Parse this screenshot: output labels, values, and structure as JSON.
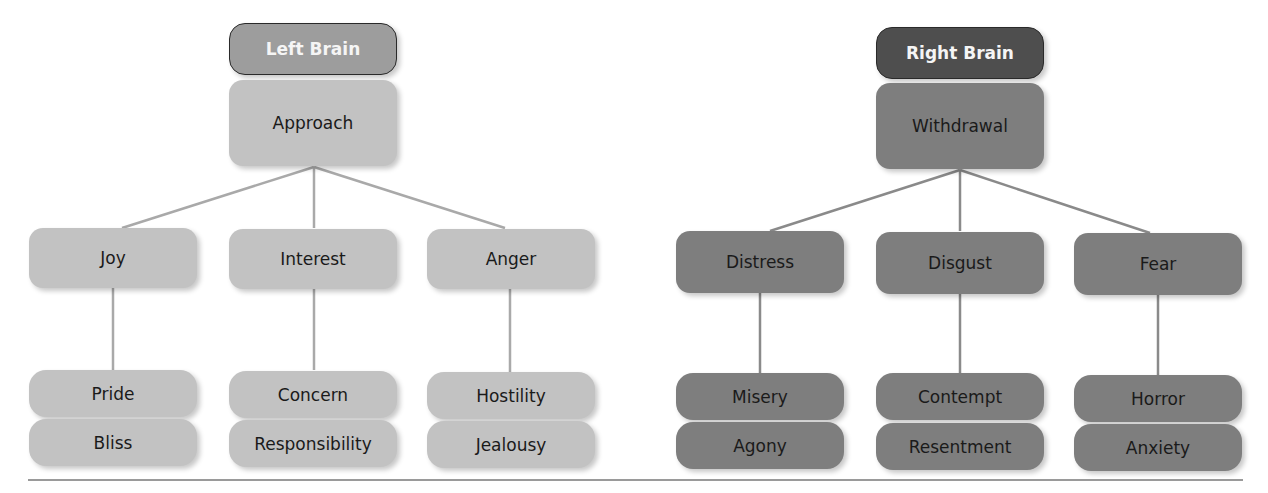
{
  "diagram": {
    "colors": {
      "left_header": "#9d9d9d",
      "left_box": "#c2c2c2",
      "right_header": "#4e4e4e",
      "right_box": "#7e7e7e",
      "connector_left": "#a9a9a9",
      "connector_right": "#8a8a8a",
      "rule": "#9a9a9a"
    },
    "left": {
      "header": "Left Brain",
      "root": "Approach",
      "children": [
        {
          "label": "Joy",
          "leaves": [
            "Pride",
            "Bliss"
          ]
        },
        {
          "label": "Interest",
          "leaves": [
            "Concern",
            "Responsibility"
          ]
        },
        {
          "label": "Anger",
          "leaves": [
            "Hostility",
            "Jealousy"
          ]
        }
      ]
    },
    "right": {
      "header": "Right Brain",
      "root": "Withdrawal",
      "children": [
        {
          "label": "Distress",
          "leaves": [
            "Misery",
            "Agony"
          ]
        },
        {
          "label": "Disgust",
          "leaves": [
            "Contempt",
            "Resentment"
          ]
        },
        {
          "label": "Fear",
          "leaves": [
            "Horror",
            "Anxiety"
          ]
        }
      ]
    }
  }
}
